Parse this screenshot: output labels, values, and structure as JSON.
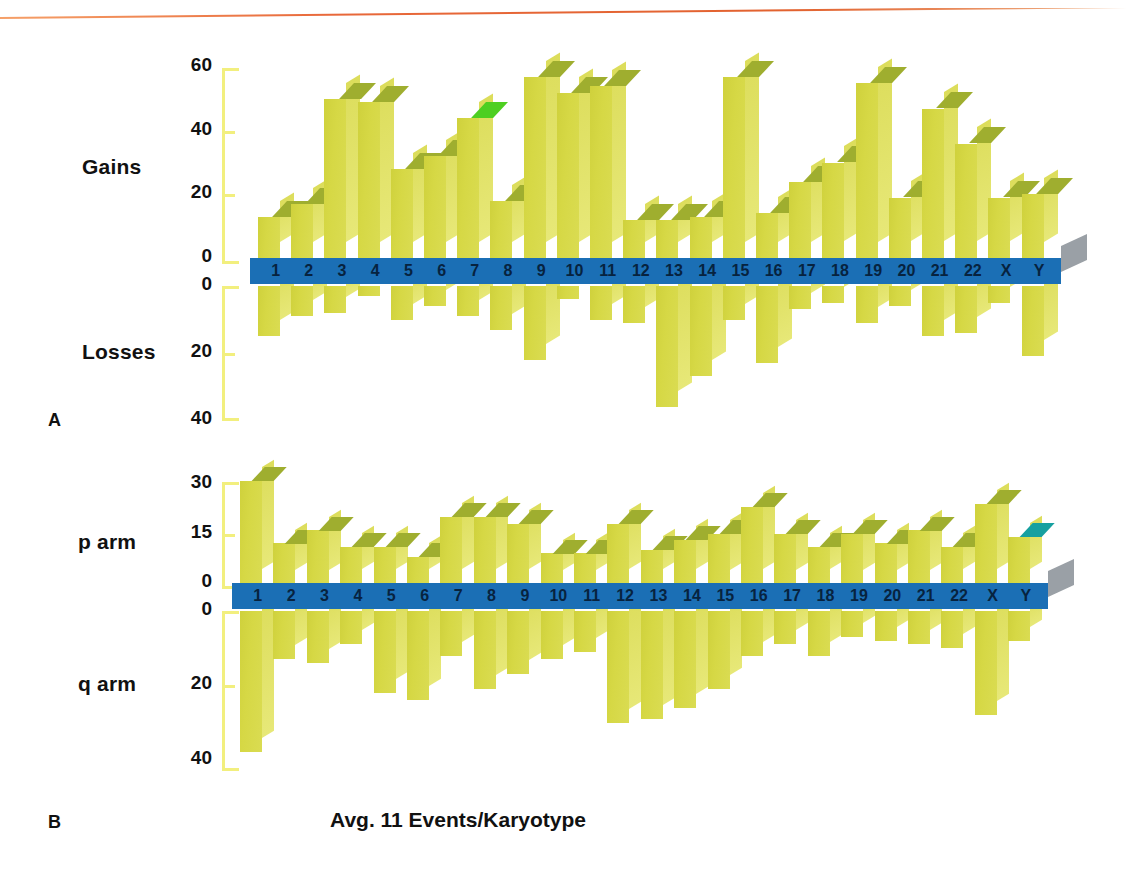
{
  "figure": {
    "caption": "Avg. 11 Events/Karyotype",
    "panel_a_letter": "A",
    "panel_b_letter": "B",
    "colors": {
      "bar_face": "#d6d845",
      "bar_lid": "#9fae2f",
      "band_blue": "#1b6fb5",
      "axis_yellow": "#f2ef7e",
      "accent_teal": "#16a0a0",
      "accent_gray": "#9aa0a6",
      "rule_orange": "#e2622f",
      "text": "#111111"
    },
    "chromosomes": [
      "1",
      "2",
      "3",
      "4",
      "5",
      "6",
      "7",
      "8",
      "9",
      "10",
      "11",
      "12",
      "13",
      "14",
      "15",
      "16",
      "17",
      "18",
      "19",
      "20",
      "21",
      "22",
      "X",
      "Y"
    ]
  },
  "chart_data": [
    {
      "type": "bar",
      "panel": "A",
      "title": "",
      "xlabel": "",
      "ylabel_top": "Gains",
      "ylabel_bottom": "Losses",
      "categories": [
        "1",
        "2",
        "3",
        "4",
        "5",
        "6",
        "7",
        "8",
        "9",
        "10",
        "11",
        "12",
        "13",
        "14",
        "15",
        "16",
        "17",
        "18",
        "19",
        "20",
        "21",
        "22",
        "X",
        "Y"
      ],
      "ylim_top": [
        0,
        60
      ],
      "ylim_bottom": [
        0,
        40
      ],
      "yticks_top": [
        "60",
        "40",
        "20",
        "0"
      ],
      "yticks_bottom": [
        "0",
        "20",
        "40"
      ],
      "grid": false,
      "legend": "none",
      "series": [
        {
          "name": "Gains",
          "direction": "up",
          "values": [
            13,
            17,
            50,
            49,
            28,
            32,
            44,
            18,
            57,
            52,
            54,
            12,
            12,
            13,
            57,
            14,
            24,
            30,
            55,
            19,
            47,
            36,
            19,
            20
          ]
        },
        {
          "name": "Losses",
          "direction": "down",
          "values": [
            15,
            9,
            8,
            3,
            10,
            6,
            9,
            13,
            22,
            4,
            10,
            11,
            36,
            27,
            10,
            23,
            7,
            5,
            11,
            6,
            15,
            14,
            5,
            21
          ]
        }
      ]
    },
    {
      "type": "bar",
      "panel": "B",
      "title": "",
      "xlabel": "",
      "ylabel_top": "p arm",
      "ylabel_bottom": "q arm",
      "categories": [
        "1",
        "2",
        "3",
        "4",
        "5",
        "6",
        "7",
        "8",
        "9",
        "10",
        "11",
        "12",
        "13",
        "14",
        "15",
        "16",
        "17",
        "18",
        "19",
        "20",
        "21",
        "22",
        "X",
        "Y"
      ],
      "ylim_top": [
        0,
        30
      ],
      "ylim_bottom": [
        0,
        40
      ],
      "yticks_top": [
        "30",
        "15",
        "0"
      ],
      "yticks_bottom": [
        "0",
        "20",
        "40"
      ],
      "grid": false,
      "legend": "none",
      "series": [
        {
          "name": "p arm",
          "direction": "up",
          "values": [
            31,
            12,
            16,
            11,
            11,
            8,
            20,
            20,
            18,
            9,
            9,
            18,
            10,
            13,
            15,
            23,
            15,
            11,
            15,
            12,
            16,
            11,
            24,
            14
          ]
        },
        {
          "name": "q arm",
          "direction": "down",
          "values": [
            38,
            13,
            14,
            9,
            22,
            24,
            12,
            21,
            17,
            13,
            11,
            30,
            29,
            26,
            21,
            12,
            9,
            12,
            7,
            8,
            9,
            10,
            28,
            8
          ]
        }
      ]
    }
  ]
}
